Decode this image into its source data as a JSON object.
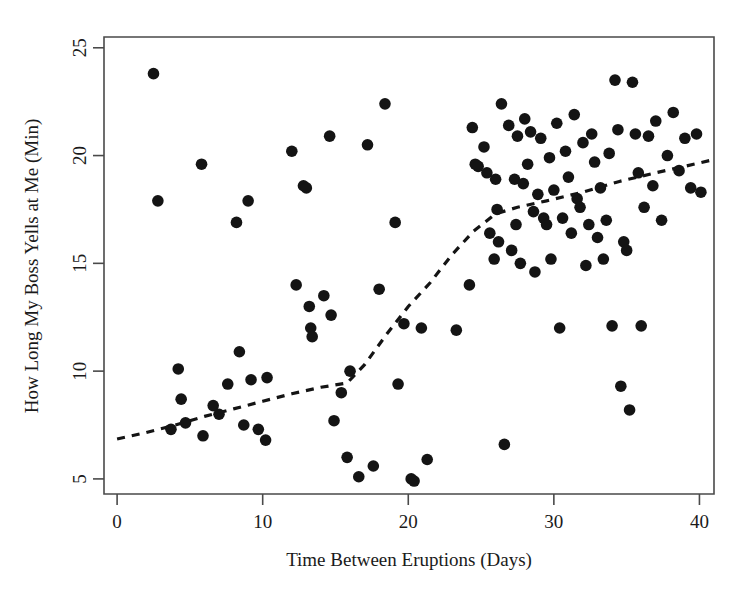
{
  "figure": {
    "title": "",
    "background_color": "#ffffff",
    "point_color": "#141414",
    "axis_color": "#4a4a4a",
    "trend_color": "#141414"
  },
  "chart_data": {
    "type": "scatter",
    "title": "",
    "xlabel": "Time Between Eruptions (Days)",
    "ylabel": "How Long My Boss Yells at Me (Min)",
    "xlim": [
      -0.9,
      41.0
    ],
    "ylim": [
      4.3,
      25.5
    ],
    "xticks": [
      0,
      10,
      20,
      30,
      40
    ],
    "yticks": [
      5,
      10,
      15,
      20,
      25
    ],
    "xtick_labels": [
      "0",
      "10",
      "20",
      "30",
      "40"
    ],
    "ytick_labels": [
      "5",
      "10",
      "15",
      "20",
      "25"
    ],
    "grid": false,
    "legend": null,
    "marker": "circle",
    "marker_size": 7.2,
    "points": [
      [
        2.5,
        23.8
      ],
      [
        2.8,
        17.9
      ],
      [
        3.7,
        7.3
      ],
      [
        4.2,
        10.1
      ],
      [
        4.4,
        8.7
      ],
      [
        4.7,
        7.6
      ],
      [
        5.8,
        19.6
      ],
      [
        5.9,
        7.0
      ],
      [
        6.6,
        8.4
      ],
      [
        7.0,
        8.0
      ],
      [
        7.6,
        9.4
      ],
      [
        8.2,
        16.9
      ],
      [
        8.4,
        10.9
      ],
      [
        8.7,
        7.5
      ],
      [
        9.0,
        17.9
      ],
      [
        9.2,
        9.6
      ],
      [
        9.7,
        7.3
      ],
      [
        10.2,
        6.8
      ],
      [
        10.3,
        9.7
      ],
      [
        12.0,
        20.2
      ],
      [
        12.3,
        14.0
      ],
      [
        12.8,
        18.6
      ],
      [
        13.0,
        18.5
      ],
      [
        13.2,
        13.0
      ],
      [
        13.3,
        12.0
      ],
      [
        13.4,
        11.6
      ],
      [
        14.2,
        13.5
      ],
      [
        14.6,
        20.9
      ],
      [
        14.7,
        12.6
      ],
      [
        14.9,
        7.7
      ],
      [
        15.4,
        9.0
      ],
      [
        15.8,
        6.0
      ],
      [
        16.0,
        10.0
      ],
      [
        16.6,
        5.1
      ],
      [
        17.2,
        20.5
      ],
      [
        17.6,
        5.6
      ],
      [
        18.0,
        13.8
      ],
      [
        18.4,
        22.4
      ],
      [
        19.1,
        16.9
      ],
      [
        19.3,
        9.4
      ],
      [
        19.7,
        12.2
      ],
      [
        20.2,
        5.0
      ],
      [
        20.4,
        4.9
      ],
      [
        20.9,
        12.0
      ],
      [
        21.3,
        5.9
      ],
      [
        23.3,
        11.9
      ],
      [
        24.2,
        14.0
      ],
      [
        24.4,
        21.3
      ],
      [
        24.6,
        19.6
      ],
      [
        24.8,
        19.5
      ],
      [
        25.2,
        20.4
      ],
      [
        25.4,
        19.2
      ],
      [
        25.6,
        16.4
      ],
      [
        25.9,
        15.2
      ],
      [
        26.0,
        18.9
      ],
      [
        26.1,
        17.5
      ],
      [
        26.2,
        16.0
      ],
      [
        26.4,
        22.4
      ],
      [
        26.6,
        6.6
      ],
      [
        26.9,
        21.4
      ],
      [
        27.1,
        15.6
      ],
      [
        27.3,
        18.9
      ],
      [
        27.4,
        16.8
      ],
      [
        27.5,
        20.9
      ],
      [
        27.7,
        15.0
      ],
      [
        27.9,
        18.7
      ],
      [
        28.0,
        21.7
      ],
      [
        28.2,
        19.6
      ],
      [
        28.4,
        21.1
      ],
      [
        28.6,
        17.4
      ],
      [
        28.7,
        14.6
      ],
      [
        28.9,
        18.2
      ],
      [
        29.1,
        20.8
      ],
      [
        29.3,
        17.1
      ],
      [
        29.5,
        16.8
      ],
      [
        29.7,
        19.9
      ],
      [
        29.8,
        15.2
      ],
      [
        30.0,
        18.4
      ],
      [
        30.2,
        21.5
      ],
      [
        30.4,
        12.0
      ],
      [
        30.6,
        17.1
      ],
      [
        30.8,
        20.2
      ],
      [
        31.0,
        19.0
      ],
      [
        31.2,
        16.4
      ],
      [
        31.4,
        21.9
      ],
      [
        31.6,
        18.0
      ],
      [
        31.8,
        17.6
      ],
      [
        32.0,
        20.6
      ],
      [
        32.2,
        14.9
      ],
      [
        32.4,
        16.8
      ],
      [
        32.6,
        21.0
      ],
      [
        32.8,
        19.7
      ],
      [
        33.0,
        16.2
      ],
      [
        33.2,
        18.5
      ],
      [
        33.4,
        15.2
      ],
      [
        33.6,
        17.0
      ],
      [
        33.8,
        20.1
      ],
      [
        34.0,
        12.1
      ],
      [
        34.2,
        23.5
      ],
      [
        34.4,
        21.2
      ],
      [
        34.6,
        9.3
      ],
      [
        34.8,
        16.0
      ],
      [
        35.0,
        15.6
      ],
      [
        35.2,
        8.2
      ],
      [
        35.4,
        23.4
      ],
      [
        35.6,
        21.0
      ],
      [
        35.8,
        19.2
      ],
      [
        36.0,
        12.1
      ],
      [
        36.2,
        17.6
      ],
      [
        36.5,
        20.9
      ],
      [
        36.8,
        18.6
      ],
      [
        37.0,
        21.6
      ],
      [
        37.4,
        17.0
      ],
      [
        37.8,
        20.0
      ],
      [
        38.2,
        22.0
      ],
      [
        38.6,
        19.3
      ],
      [
        39.0,
        20.8
      ],
      [
        39.4,
        18.5
      ],
      [
        39.8,
        21.0
      ],
      [
        40.1,
        18.3
      ]
    ],
    "trend": {
      "style": "dashed",
      "label": "",
      "points": [
        [
          0.0,
          6.85
        ],
        [
          2.0,
          7.15
        ],
        [
          4.0,
          7.5
        ],
        [
          6.0,
          7.9
        ],
        [
          8.0,
          8.25
        ],
        [
          10.0,
          8.6
        ],
        [
          12.0,
          8.95
        ],
        [
          14.0,
          9.25
        ],
        [
          15.8,
          9.45
        ],
        [
          17.0,
          10.3
        ],
        [
          18.5,
          11.7
        ],
        [
          20.0,
          13.0
        ],
        [
          21.5,
          14.1
        ],
        [
          23.0,
          15.4
        ],
        [
          24.5,
          16.5
        ],
        [
          26.0,
          17.3
        ],
        [
          27.5,
          17.6
        ],
        [
          29.5,
          17.9
        ],
        [
          32.0,
          18.3
        ],
        [
          34.5,
          18.8
        ],
        [
          37.0,
          19.2
        ],
        [
          39.0,
          19.5
        ],
        [
          40.9,
          19.8
        ]
      ]
    }
  },
  "axes": {
    "frame": {
      "left_px": 104,
      "right_px": 714,
      "top_px": 37,
      "bottom_px": 494
    },
    "x_axis_name": "x-axis",
    "y_axis_name": "y-axis"
  }
}
